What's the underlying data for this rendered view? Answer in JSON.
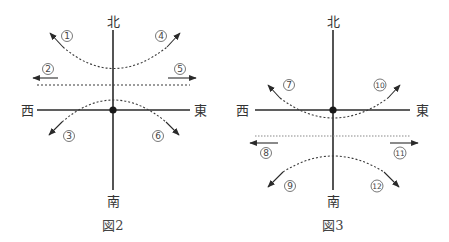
{
  "figures": [
    {
      "caption": "図2",
      "directions": {
        "north": "北",
        "south": "南",
        "west": "西",
        "east": "東"
      },
      "labels": [
        "①",
        "②",
        "③",
        "④",
        "⑤",
        "⑥"
      ],
      "description": "Upper curve opening upward (arrows ① NW, ④ NE), horizontal dotted line with arrows ② west and ⑤ east, lower arch through origin region (arrows ③ SW, ⑥ SE)"
    },
    {
      "caption": "図3",
      "directions": {
        "north": "北",
        "south": "南",
        "west": "西",
        "east": "東"
      },
      "labels": [
        "⑦",
        "⑧",
        "⑨",
        "⑩",
        "⑪",
        "⑫"
      ],
      "description": "Upper curve dipping below origin (arrows ⑦ NW, ⑩ NE), horizontal dotted line below axis with arrows ⑧ west and ⑪ east, lower arch (arrows ⑨ SW, ⑫ SE)"
    }
  ],
  "numbers": {
    "n1": "1",
    "n2": "2",
    "n3": "3",
    "n4": "4",
    "n5": "5",
    "n6": "6",
    "n7": "7",
    "n8": "8",
    "n9": "9",
    "n10": "10",
    "n11": "11",
    "n12": "12"
  }
}
